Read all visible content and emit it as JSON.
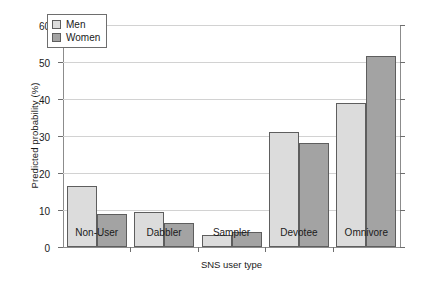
{
  "chart_data": {
    "type": "bar",
    "title": "",
    "xlabel": "SNS user type",
    "ylabel": "Predicted probability (%)",
    "categories": [
      "Non-User",
      "Dabbler",
      "Sampler",
      "Devotee",
      "Omnivore"
    ],
    "series": [
      {
        "name": "Men",
        "color": "#dcdcdc",
        "values": [
          16.6,
          9.4,
          3.3,
          31.2,
          38.8
        ]
      },
      {
        "name": "Women",
        "color": "#a3a3a3",
        "values": [
          8.8,
          6.6,
          4.1,
          28.2,
          51.6
        ]
      }
    ],
    "ylim": [
      0,
      60
    ],
    "yticks": [
      0,
      10,
      20,
      30,
      40,
      50,
      60
    ],
    "ytick_labels": [
      "0",
      "10",
      "20",
      "30",
      "40",
      "50",
      "60"
    ],
    "grid": true,
    "legend_position": "top-left"
  },
  "legend": {
    "items": [
      {
        "label": "Men"
      },
      {
        "label": "Women"
      }
    ]
  }
}
